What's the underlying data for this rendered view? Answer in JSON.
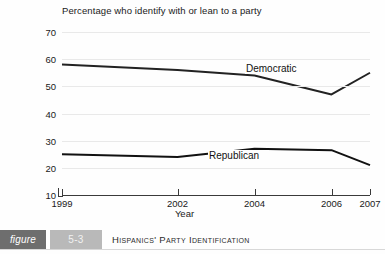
{
  "chart_data": {
    "type": "line",
    "title": "Percentage who identify with or lean to a party",
    "xlabel": "Year",
    "ylabel": "",
    "x": [
      1999,
      2002,
      2004,
      2006,
      2007
    ],
    "xtick_labels": [
      "1999",
      "2002",
      "2004",
      "2006",
      "2007"
    ],
    "ytick_labels": [
      "10",
      "20",
      "30",
      "40",
      "50",
      "60",
      "70"
    ],
    "yticks": [
      10,
      20,
      30,
      40,
      50,
      60,
      70
    ],
    "ylim": [
      10,
      70
    ],
    "xlim": [
      1999,
      2007
    ],
    "grid": "horizontal",
    "legend_position": "inline-annotation",
    "series": [
      {
        "name": "Democratic",
        "values": [
          58,
          56,
          54,
          47,
          55
        ],
        "color": "#222222"
      },
      {
        "name": "Republican",
        "values": [
          25,
          24,
          27,
          26.5,
          21
        ],
        "color": "#111111"
      }
    ],
    "annotations": [
      {
        "text": "Democratic",
        "near_series": "Democratic"
      },
      {
        "text": "Republican",
        "near_series": "Republican"
      }
    ]
  },
  "caption": {
    "figure_label": "figure",
    "figure_number": "5-3",
    "figure_title": "Hispanics' Party Identification"
  }
}
